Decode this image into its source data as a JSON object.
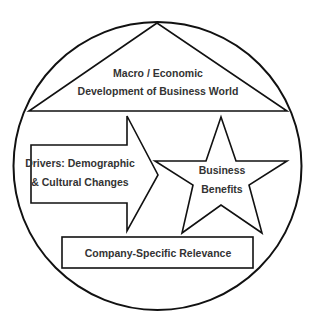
{
  "diagram": {
    "colors": {
      "stroke": "#111111",
      "text": "#333333",
      "background": "#ffffff"
    },
    "outer_circle": {
      "shape": "circle"
    },
    "top_triangle": {
      "line1": "Macro / Economic",
      "line2": "Development of Business World"
    },
    "drivers_arrow": {
      "line1": "Drivers: Demographic",
      "line2": "& Cultural Changes"
    },
    "benefits_star": {
      "line1": "Business",
      "line2": "Benefits"
    },
    "relevance_box": {
      "label": "Company-Specific Relevance"
    }
  }
}
